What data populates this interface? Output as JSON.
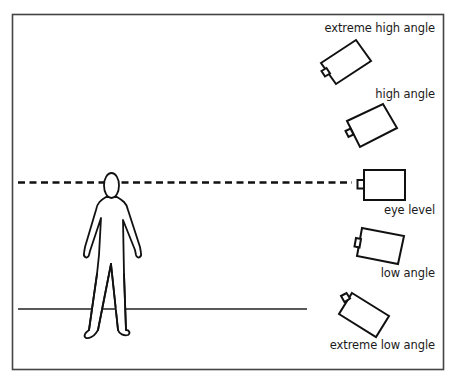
{
  "diagram": {
    "labels": {
      "extreme_high": "extreme high angle",
      "high": "high angle",
      "eye_level": "eye level",
      "low": "low angle",
      "extreme_low": "extreme low angle"
    },
    "colors": {
      "stroke": "#111111",
      "frame": "#444444",
      "background": "#ffffff"
    }
  }
}
